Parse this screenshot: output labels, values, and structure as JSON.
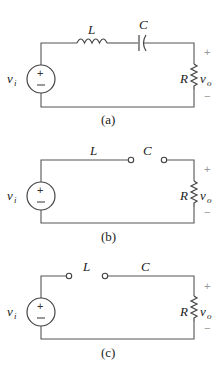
{
  "figure": {
    "circuits": [
      {
        "id": "a",
        "caption": "(a)",
        "inductor_label": "L",
        "capacitor_label": "C",
        "resistor_label": "R",
        "source_label": "v",
        "source_sub": "i",
        "output_label": "v",
        "output_sub": "o",
        "plus": "+",
        "minus": "−",
        "state": "inductor and capacitor in series"
      },
      {
        "id": "b",
        "caption": "(b)",
        "inductor_label": "L",
        "capacitor_label": "C",
        "resistor_label": "R",
        "source_label": "v",
        "source_sub": "i",
        "output_label": "v",
        "output_sub": "o",
        "plus": "+",
        "minus": "−",
        "state": "inductor short, capacitor open"
      },
      {
        "id": "c",
        "caption": "(c)",
        "inductor_label": "L",
        "capacitor_label": "C",
        "resistor_label": "R",
        "source_label": "v",
        "source_sub": "i",
        "output_label": "v",
        "output_sub": "o",
        "plus": "+",
        "minus": "−",
        "state": "inductor open, capacitor short"
      }
    ]
  }
}
